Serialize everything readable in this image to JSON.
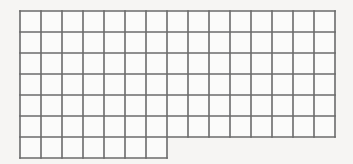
{
  "figure": {
    "name": "stepped-rectangle-grid",
    "background_color": "#f6f5f3",
    "line_color": "#6b6b6b",
    "cell_fill_color": "#fbfbfa",
    "line_width": 1.6,
    "cell_size_px": 21,
    "origin": {
      "x": 20,
      "y": 11
    },
    "main_block": {
      "columns": 15,
      "rows": 6,
      "left": 20,
      "top": 11,
      "right": 335,
      "bottom": 137
    },
    "step_block": {
      "columns": 7,
      "rows": 1,
      "left": 20,
      "top": 137,
      "right": 167,
      "bottom": 158
    },
    "total_cells": 97,
    "labels": [],
    "tick_labels": []
  }
}
